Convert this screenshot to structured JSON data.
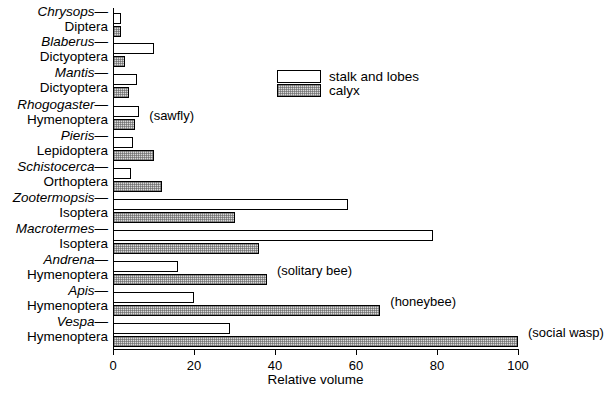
{
  "chart_data": {
    "type": "bar",
    "orientation": "horizontal",
    "title": "",
    "xlabel": "Relative volume",
    "ylabel": "",
    "xlim": [
      0,
      100
    ],
    "xticks": [
      0,
      20,
      40,
      60,
      80,
      100
    ],
    "xtick_labels": [
      "0",
      "20",
      "40",
      "60",
      "80",
      "100"
    ],
    "grid": false,
    "legend_position": "upper-right-inside",
    "legend": [
      "stalk and lobes",
      "calyx"
    ],
    "categories": [
      {
        "genus": "Chrysops—",
        "order": "Diptera"
      },
      {
        "genus": "Blaberus—",
        "order": "Dictyoptera"
      },
      {
        "genus": "Mantis—",
        "order": "Dictyoptera"
      },
      {
        "genus": "Rhogogaster—",
        "order": "Hymenoptera"
      },
      {
        "genus": "Pieris—",
        "order": "Lepidoptera"
      },
      {
        "genus": "Schistocerca—",
        "order": "Orthoptera"
      },
      {
        "genus": "Zootermopsis—",
        "order": "Isoptera"
      },
      {
        "genus": "Macrotermes—",
        "order": "Isoptera"
      },
      {
        "genus": "Andrena—",
        "order": "Hymenoptera"
      },
      {
        "genus": "Apis—",
        "order": "Hymenoptera"
      },
      {
        "genus": "Vespa—",
        "order": "Hymenoptera"
      }
    ],
    "series": [
      {
        "name": "stalk and lobes",
        "values": [
          2,
          10,
          6,
          6.5,
          5,
          4.5,
          58,
          79,
          16,
          20,
          29
        ]
      },
      {
        "name": "calyx",
        "values": [
          2,
          3,
          4,
          5.5,
          10,
          12,
          30,
          36,
          38,
          66,
          100
        ]
      }
    ],
    "annotations": [
      {
        "text": "(sawfly)",
        "category": "Rhogogaster—"
      },
      {
        "text": "(solitary bee)",
        "category": "Andrena—"
      },
      {
        "text": "(honeybee)",
        "category": "Apis—"
      },
      {
        "text": "(social wasp)",
        "category": "Vespa—"
      }
    ]
  },
  "legend": {
    "stalk_label": "stalk and lobes",
    "calyx_label": "calyx"
  },
  "axis": {
    "x_title": "Relative volume",
    "t0": "0",
    "t1": "20",
    "t2": "40",
    "t3": "60",
    "t4": "80",
    "t5": "100"
  },
  "annotations": {
    "sawfly": "(sawfly)",
    "solitary_bee": "(solitary bee)",
    "honeybee": "(honeybee)",
    "social_wasp": "(social wasp)"
  },
  "colors": {
    "axis": "#000000",
    "stalk_fill": "#ffffff",
    "calyx_fill": "#d9d9d9",
    "background": "#ffffff"
  },
  "rows": [
    {
      "genus": "Chrysops—",
      "order": "Diptera"
    },
    {
      "genus": "Blaberus—",
      "order": "Dictyoptera"
    },
    {
      "genus": "Mantis—",
      "order": "Dictyoptera"
    },
    {
      "genus": "Rhogogaster—",
      "order": "Hymenoptera"
    },
    {
      "genus": "Pieris—",
      "order": "Lepidoptera"
    },
    {
      "genus": "Schistocerca—",
      "order": "Orthoptera"
    },
    {
      "genus": "Zootermopsis—",
      "order": "Isoptera"
    },
    {
      "genus": "Macrotermes—",
      "order": "Isoptera"
    },
    {
      "genus": "Andrena—",
      "order": "Hymenoptera"
    },
    {
      "genus": "Apis—",
      "order": "Hymenoptera"
    },
    {
      "genus": "Vespa—",
      "order": "Hymenoptera"
    }
  ]
}
